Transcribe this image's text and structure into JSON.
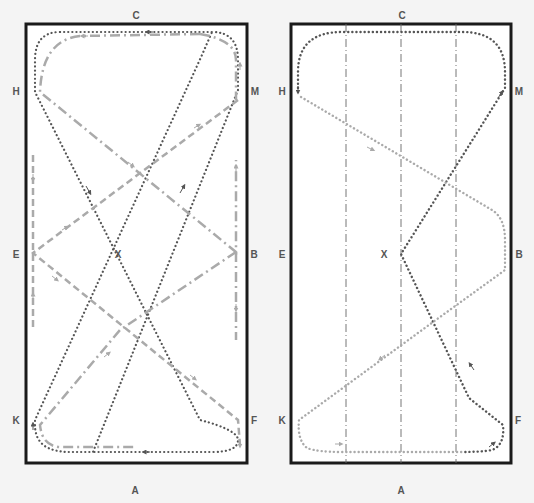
{
  "colors": {
    "background": "#f4f4f4",
    "arena_fill": "#ffffff",
    "arena_border": "#1a1a1a",
    "dark_path": "#555555",
    "light_path": "#aaaaaa",
    "letter": "#555555",
    "guide_line": "#666666"
  },
  "arenas": [
    {
      "id": "left",
      "letters": {
        "top": "C",
        "bottom": "A",
        "left_top": "H",
        "left_mid": "E",
        "left_bottom": "K",
        "right_top": "M",
        "right_mid": "B",
        "right_bottom": "F",
        "center": "X"
      },
      "patterns": [
        {
          "name": "dotted-figure-eight",
          "style": "dotted",
          "color": "dark"
        },
        {
          "name": "dash-dot-serpentine",
          "style": "dash-dot",
          "color": "light"
        },
        {
          "name": "dashed-zigzag",
          "style": "dashed",
          "color": "light"
        }
      ]
    },
    {
      "id": "right",
      "letters": {
        "top": "C",
        "bottom": "A",
        "left_top": "H",
        "left_mid": "E",
        "left_bottom": "K",
        "right_top": "M",
        "right_mid": "B",
        "right_bottom": "F",
        "center": "X"
      },
      "guide_lines": 3,
      "patterns": [
        {
          "name": "dotted-dark-loop",
          "style": "dotted",
          "color": "dark"
        },
        {
          "name": "dotted-light-loop",
          "style": "dotted",
          "color": "light"
        }
      ]
    }
  ]
}
